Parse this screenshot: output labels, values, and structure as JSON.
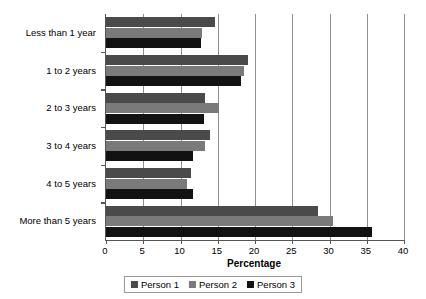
{
  "chart_data": {
    "type": "bar",
    "orientation": "horizontal",
    "title": "",
    "xlabel": "Percentage",
    "ylabel": "",
    "xlim": [
      0,
      40
    ],
    "xticks": [
      0,
      5,
      10,
      15,
      20,
      25,
      30,
      35,
      40
    ],
    "grid": true,
    "legend_position": "bottom",
    "categories": [
      "Less than 1 year",
      "1 to 2 years",
      "2 to 3 years",
      "3 to 4 years",
      "4 to 5 years",
      "More than 5 years"
    ],
    "series": [
      {
        "name": "Person 1",
        "color": "#4a4a4a",
        "values": [
          14.6,
          19.1,
          13.3,
          13.9,
          11.4,
          28.4
        ]
      },
      {
        "name": "Person 2",
        "color": "#7a7a7a",
        "values": [
          12.9,
          18.5,
          15.2,
          13.3,
          10.9,
          30.5
        ]
      },
      {
        "name": "Person 3",
        "color": "#121212",
        "values": [
          12.7,
          18.1,
          13.2,
          11.7,
          11.7,
          35.7
        ]
      }
    ]
  }
}
